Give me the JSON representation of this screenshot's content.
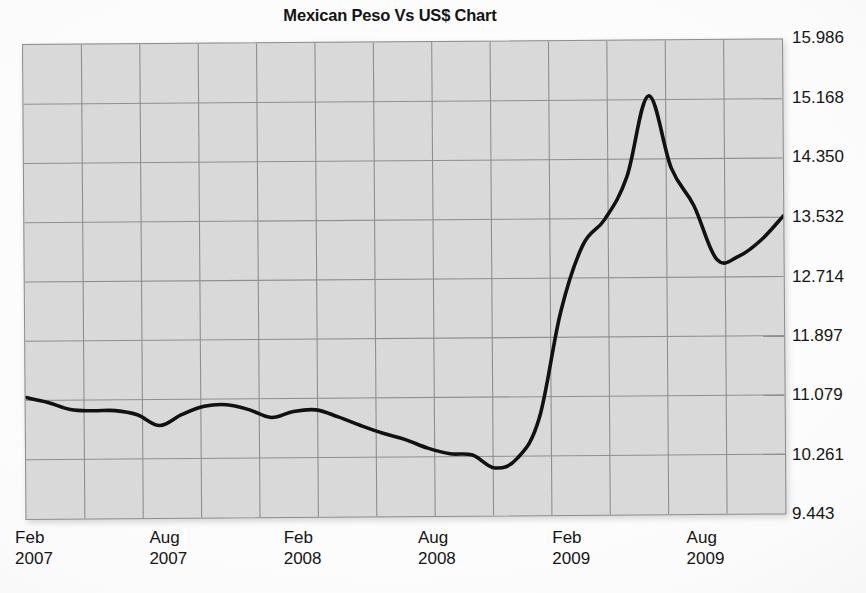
{
  "chart_data": {
    "type": "line",
    "title": "Mexican Peso Vs US$ Chart",
    "xlabel": "",
    "ylabel": "",
    "grid": true,
    "legend": "none",
    "line_color": "#111111",
    "plot_background": "#d9d9d9",
    "grid_color": "#8f8f8f",
    "ylim": [
      9.443,
      15.986
    ],
    "y_ticks": [
      "15.986",
      "15.168",
      "14.350",
      "13.532",
      "12.714",
      "11.897",
      "11.079",
      "10.261",
      "9.443"
    ],
    "y_tick_values": [
      15.986,
      15.168,
      14.35,
      13.532,
      12.714,
      11.897,
      11.079,
      10.261,
      9.443
    ],
    "x_ticks": [
      {
        "month": "Feb",
        "year": "2007"
      },
      {
        "month": "Aug",
        "year": "2007"
      },
      {
        "month": "Feb",
        "year": "2008"
      },
      {
        "month": "Aug",
        "year": "2008"
      },
      {
        "month": "Feb",
        "year": "2009"
      },
      {
        "month": "Aug",
        "year": "2009"
      }
    ],
    "x_tick_labels": [
      "Feb 2007",
      "Aug 2007",
      "Feb 2008",
      "Aug 2008",
      "Feb 2009",
      "Aug 2009"
    ],
    "xlim": [
      "Feb 2007",
      "Dec 2009"
    ],
    "series": [
      {
        "name": "MXN per USD",
        "x": [
          "Feb 2007",
          "Mar 2007",
          "Apr 2007",
          "May 2007",
          "Jun 2007",
          "Jul 2007",
          "Aug 2007",
          "Sep 2007",
          "Oct 2007",
          "Nov 2007",
          "Dec 2007",
          "Jan 2008",
          "Feb 2008",
          "Mar 2008",
          "Apr 2008",
          "May 2008",
          "Jun 2008",
          "Jul 2008",
          "Aug 2008",
          "Sep 2008",
          "Oct 2008",
          "Nov 2008",
          "Dec 2008",
          "Jan 2009",
          "Feb 2009",
          "Mar 2009",
          "Apr 2009",
          "May 2009",
          "Jun 2009",
          "Jul 2009",
          "Aug 2009",
          "Sep 2009",
          "Oct 2009",
          "Nov 2009",
          "Dec 2009"
        ],
        "values": [
          11.12,
          11.05,
          10.95,
          10.93,
          10.93,
          10.87,
          10.72,
          10.87,
          10.98,
          11.0,
          10.93,
          10.82,
          10.9,
          10.92,
          10.82,
          10.7,
          10.59,
          10.5,
          10.38,
          10.3,
          10.28,
          10.1,
          10.23,
          10.78,
          12.25,
          13.16,
          13.52,
          14.1,
          15.22,
          14.22,
          13.7,
          12.96,
          13.0,
          13.22,
          13.55
        ]
      }
    ],
    "annotations": []
  },
  "figure": {
    "title": "Mexican Peso Vs US$ Chart"
  }
}
